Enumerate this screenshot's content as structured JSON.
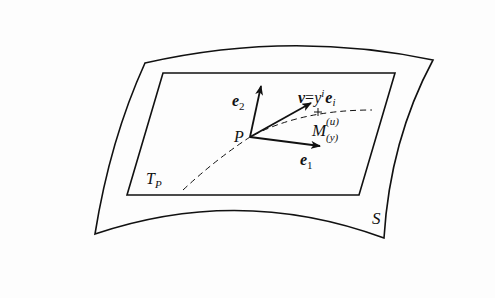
{
  "diagram": {
    "type": "tangent-plane-illustration",
    "colors": {
      "stroke": "#111111",
      "background": "#fdfdfd"
    },
    "labels": {
      "surface": "S",
      "tangent_plane_T": "T",
      "tangent_plane_sub": "P",
      "point": "P",
      "e1_base": "e",
      "e1_sub": "1",
      "e2_base": "e",
      "e2_sub": "2",
      "v_lhs": "v",
      "v_eq": "=",
      "v_y": "y",
      "v_sup": "i",
      "v_e": "e",
      "v_sub": "i",
      "M_base": "M",
      "M_sup": "(u)",
      "M_sub": "(y)"
    },
    "nodes": [
      {
        "id": "S",
        "label": "S",
        "kind": "curved-surface"
      },
      {
        "id": "TP",
        "label": "T_P",
        "kind": "tangent-plane"
      },
      {
        "id": "P",
        "label": "P",
        "kind": "point"
      },
      {
        "id": "e1",
        "label": "e_1",
        "kind": "basis-vector"
      },
      {
        "id": "e2",
        "label": "e_2",
        "kind": "basis-vector"
      },
      {
        "id": "v",
        "label": "v = y^i e_i",
        "kind": "tangent-vector"
      },
      {
        "id": "M",
        "label": "M_(y)^(u)",
        "kind": "curve-point"
      }
    ],
    "edges": [
      {
        "from": "P",
        "to": "e1",
        "style": "arrow"
      },
      {
        "from": "P",
        "to": "e2",
        "style": "arrow"
      },
      {
        "from": "P",
        "to": "v",
        "style": "arrow"
      },
      {
        "from": "P",
        "to": "M",
        "style": "dashed-curve"
      }
    ]
  }
}
